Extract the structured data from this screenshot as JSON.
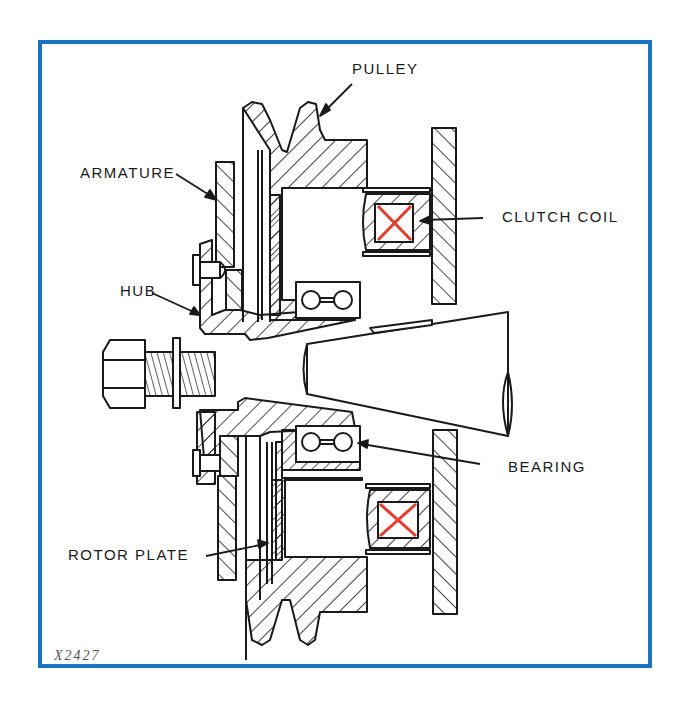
{
  "figure": {
    "figure_number": "X2427",
    "frame_color": "#1a73c4",
    "coil_mark_color": "#e53b2c",
    "line_color": "#1a1a1a"
  },
  "labels": {
    "pulley": "PULLEY",
    "armature": "ARMATURE",
    "clutch_coil": "CLUTCH COIL",
    "hub": "HUB",
    "bearing": "BEARING",
    "rotor_plate": "ROTOR PLATE"
  },
  "components": [
    {
      "name": "pulley",
      "label": "PULLEY"
    },
    {
      "name": "armature",
      "label": "ARMATURE"
    },
    {
      "name": "clutch-coil",
      "label": "CLUTCH COIL"
    },
    {
      "name": "hub",
      "label": "HUB"
    },
    {
      "name": "bearing",
      "label": "BEARING"
    },
    {
      "name": "rotor-plate",
      "label": "ROTOR PLATE"
    },
    {
      "name": "bolt",
      "label": ""
    },
    {
      "name": "shaft",
      "label": ""
    }
  ]
}
